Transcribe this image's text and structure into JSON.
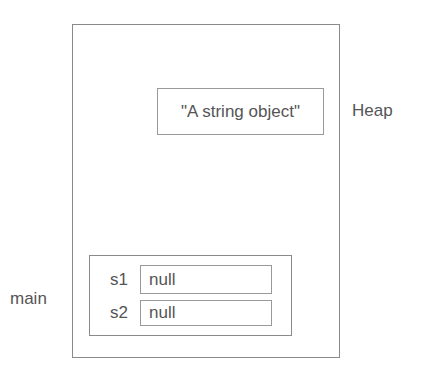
{
  "diagram": {
    "type": "memory-layout",
    "regions": {
      "heap_label": "Heap",
      "stack_frame_label": "main"
    },
    "heap_objects": [
      {
        "value": "\"A string object\""
      }
    ],
    "stack_frame": {
      "variables": [
        {
          "name": "s1",
          "value": "null"
        },
        {
          "name": "s2",
          "value": "null"
        }
      ]
    },
    "colors": {
      "border": "#8a8a8a",
      "text": "#555555",
      "background": "#ffffff"
    }
  }
}
